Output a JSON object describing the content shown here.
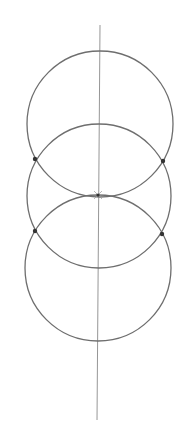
{
  "diagram": {
    "title": "",
    "background": "#ffffff",
    "stroke_color": "#6e6e6e",
    "axis_color": "#8a8a8a",
    "point_color": "#333333",
    "axis": {
      "x1": 100,
      "y1": 25,
      "x2": 97,
      "y2": 420
    },
    "circles": [
      {
        "id": "top",
        "cx": 100,
        "cy": 124,
        "r": 73
      },
      {
        "id": "middle",
        "cx": 99,
        "cy": 196,
        "r": 72
      },
      {
        "id": "bottom",
        "cx": 98,
        "cy": 268,
        "r": 73
      }
    ],
    "intersection_points": [
      {
        "id": "upper-left",
        "x": 35,
        "y": 159
      },
      {
        "id": "upper-right",
        "x": 163,
        "y": 161
      },
      {
        "id": "lower-left",
        "x": 35,
        "y": 231
      },
      {
        "id": "lower-right",
        "x": 162,
        "y": 234
      }
    ],
    "center_mark": {
      "x": 98,
      "y": 195
    }
  }
}
